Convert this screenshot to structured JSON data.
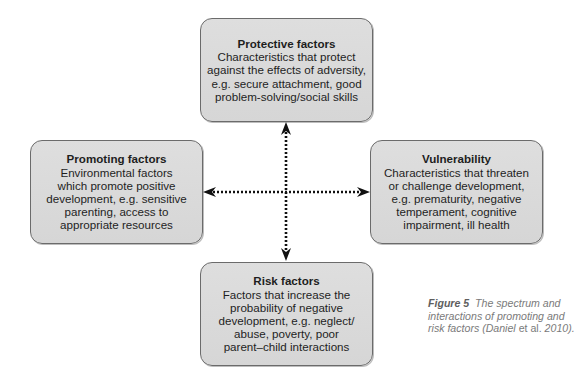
{
  "diagram": {
    "nodes": {
      "protective": {
        "title": "Protective factors",
        "body": "Characteristics that protect\nagainst the effects of adversity,\ne.g. secure attachment, good\nproblem-solving/social skills"
      },
      "promoting": {
        "title": "Promoting factors",
        "body": "Environmental factors\nwhich promote positive\ndevelopment, e.g. sensitive\nparenting, access to\nappropriate resources"
      },
      "vulnerability": {
        "title": "Vulnerability",
        "body": "Characteristics that threaten\nor challenge development,\ne.g. prematurity, negative\ntemperament, cognitive\nimpairment, ill health"
      },
      "risk": {
        "title": "Risk factors",
        "body": "Factors that increase the\nprobability of negative\ndevelopment, e.g. neglect/\nabuse, poverty, poor\nparent–child interactions"
      }
    },
    "edges": [
      {
        "from": "protective",
        "to": "risk",
        "style": "dotted",
        "direction": "both"
      },
      {
        "from": "promoting",
        "to": "vulnerability",
        "style": "dotted",
        "direction": "both"
      }
    ],
    "colors": {
      "box_fill": "#d9d9d9",
      "box_border": "#6b6b6b",
      "arrow": "#111111",
      "caption": "#7a7a7a"
    }
  },
  "caption": {
    "label": "Figure 5",
    "text_1": "The spectrum and interactions of promoting and risk factors (",
    "author": "Daniel",
    "etal": " et al.",
    "text_2": " 2010)."
  }
}
